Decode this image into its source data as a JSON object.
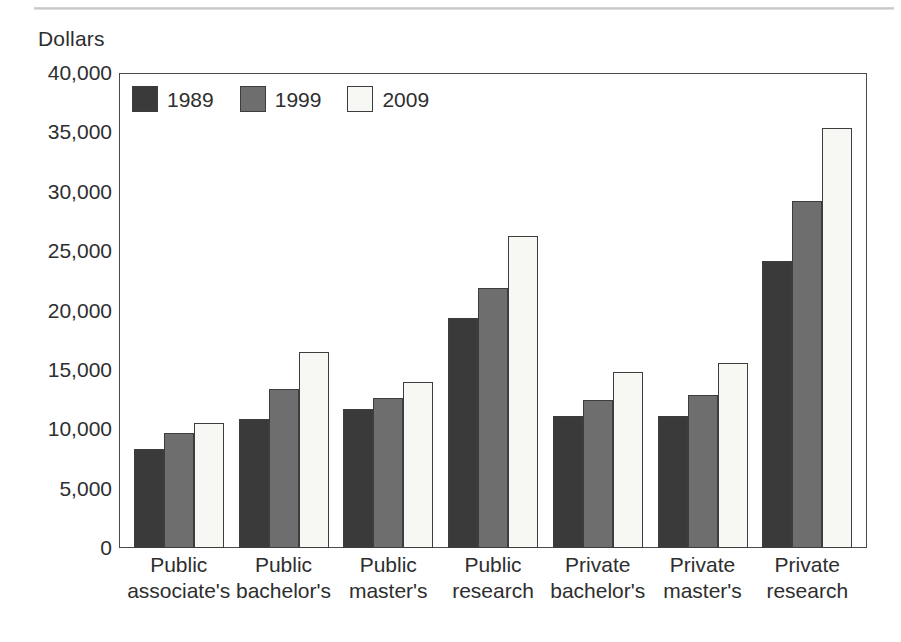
{
  "chart_data": {
    "type": "bar",
    "title": "",
    "subtitle": "",
    "xlabel": "",
    "ylabel": "Dollars",
    "ylim": [
      0,
      40000
    ],
    "y_ticks": [
      0,
      5000,
      10000,
      15000,
      20000,
      25000,
      30000,
      35000,
      40000
    ],
    "y_tick_labels": [
      "0",
      "5,000",
      "10,000",
      "15,000",
      "20,000",
      "25,000",
      "30,000",
      "35,000",
      "40,000"
    ],
    "grid": false,
    "legend_position": "top-left-inside",
    "categories": [
      "Public associate's",
      "Public bachelor's",
      "Public master's",
      "Public research",
      "Private bachelor's",
      "Private master's",
      "Private research"
    ],
    "category_lines": [
      [
        "Public",
        "associate's"
      ],
      [
        "Public",
        "bachelor's"
      ],
      [
        "Public",
        "master's"
      ],
      [
        "Public",
        "research"
      ],
      [
        "Private",
        "bachelor's"
      ],
      [
        "Private",
        "master's"
      ],
      [
        "Private",
        "research"
      ]
    ],
    "series": [
      {
        "name": "1989",
        "color": "#3a3a3a",
        "values": [
          8300,
          10900,
          11700,
          19400,
          11100,
          11100,
          24200
        ]
      },
      {
        "name": "1999",
        "color": "#6e6e6e",
        "values": [
          9700,
          13400,
          12600,
          21900,
          12500,
          12900,
          29200
        ]
      },
      {
        "name": "2009",
        "color": "#f7f7f3",
        "values": [
          10500,
          16500,
          14000,
          26300,
          14800,
          15600,
          35400
        ]
      }
    ]
  },
  "legend": {
    "entries": [
      {
        "label": "1989",
        "color": "#3a3a3a"
      },
      {
        "label": "1999",
        "color": "#6e6e6e"
      },
      {
        "label": "2009",
        "color": "#f7f7f3"
      }
    ]
  },
  "axis": {
    "y_title": "Dollars"
  }
}
